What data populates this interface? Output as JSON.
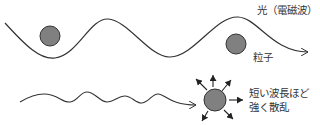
{
  "diagram": {
    "labels": {
      "light": "光（電磁波）",
      "particle": "粒子",
      "scatter_line1": "短い波長ほど",
      "scatter_line2": "強く散乱"
    },
    "elements": {
      "long_wave": "long-wavelength light wave passing particles",
      "short_wave": "short-wavelength light wave hitting particle",
      "scatter_arrows": 7
    },
    "colors": {
      "line": "#333333",
      "particle_fill": "#808080",
      "particle_stroke": "#333333",
      "text": "#333333"
    }
  }
}
